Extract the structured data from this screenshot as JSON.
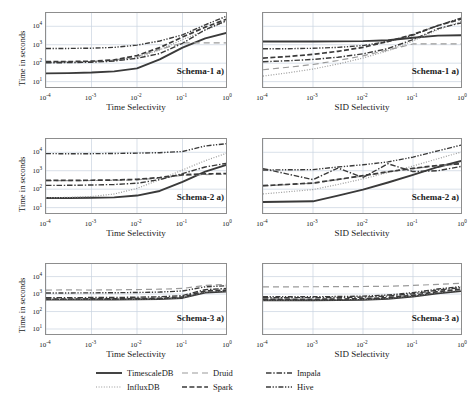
{
  "figure": {
    "background": "#ffffff",
    "width": 476,
    "height": 404
  },
  "legend": {
    "position": "bottom-center",
    "entries": [
      {
        "label": "TimescaleDB",
        "style": "solid",
        "color": "#3a3a3a",
        "width": 1.9
      },
      {
        "label": "InfluxDB",
        "style": "dotted",
        "color": "#9a9a9a",
        "width": 1.2
      },
      {
        "label": "Druid",
        "style": "dashed-long",
        "color": "#9a9a9a",
        "width": 1.2
      },
      {
        "label": "Spark",
        "style": "dashed",
        "color": "#3a3a3a",
        "width": 1.7
      },
      {
        "label": "Impala",
        "style": "dashdot",
        "color": "#3a3a3a",
        "width": 1.4
      },
      {
        "label": "Hive",
        "style": "dashdotdot",
        "color": "#3a3a3a",
        "width": 1.4
      }
    ]
  },
  "axes_common": {
    "ylabel": "Time in seconds",
    "yticks": [
      "10⁻⁴"
    ],
    "ytick_exponents": [
      "1",
      "2",
      "3",
      "4"
    ],
    "xtick_exponents": [
      "-4",
      "-3",
      "-2",
      "-1",
      "0"
    ],
    "ylim_log": [
      0.6,
      4.7
    ],
    "xlim_log": [
      -4,
      0
    ],
    "grid": true,
    "grid_color": "#c9d3e0",
    "mantissa": "10"
  },
  "chart_data": [
    {
      "id": "schema1-time",
      "type": "line",
      "title": "Schema-1 a)",
      "xlabel": "Time Selectivity",
      "ylabel": "Time in seconds",
      "xscale": "log",
      "yscale": "log",
      "xlim": [
        0.0001,
        1
      ],
      "ylim": [
        4,
        50000
      ],
      "x": [
        0.0001,
        0.000316,
        0.001,
        0.00316,
        0.01,
        0.0316,
        0.1,
        0.316,
        1
      ],
      "series": [
        {
          "name": "TimescaleDB",
          "values": [
            28,
            29,
            31,
            36,
            52,
            160,
            700,
            2200,
            4600
          ]
        },
        {
          "name": "InfluxDB",
          "values": [
            110,
            112,
            118,
            135,
            200,
            520,
            1900,
            6000,
            20000
          ]
        },
        {
          "name": "Druid",
          "values": [
            115,
            118,
            125,
            145,
            230,
            560,
            1250,
            1250,
            1250
          ]
        },
        {
          "name": "Spark",
          "values": [
            120,
            122,
            128,
            150,
            260,
            700,
            2600,
            9000,
            26000
          ]
        },
        {
          "name": "Impala",
          "values": [
            105,
            107,
            112,
            130,
            185,
            330,
            1200,
            6500,
            22000
          ]
        },
        {
          "name": "Hive",
          "values": [
            620,
            630,
            650,
            720,
            950,
            1600,
            3400,
            12000,
            38000
          ]
        }
      ]
    },
    {
      "id": "schema1-sid",
      "type": "line",
      "title": "Schema-1 a)",
      "xlabel": "SID Selectivity",
      "ylabel": "Time in seconds",
      "xscale": "log",
      "yscale": "log",
      "xlim": [
        0.0001,
        1
      ],
      "ylim": [
        4,
        50000
      ],
      "x": [
        0.0001,
        0.000316,
        0.001,
        0.00316,
        0.01,
        0.0316,
        0.1,
        0.316,
        1
      ],
      "series": [
        {
          "name": "TimescaleDB",
          "values": [
            1500,
            1500,
            1510,
            1520,
            1560,
            1750,
            2400,
            3100,
            3300
          ]
        },
        {
          "name": "InfluxDB",
          "values": [
            20,
            30,
            48,
            90,
            190,
            470,
            1600,
            6500,
            20000
          ]
        },
        {
          "name": "Druid",
          "values": [
            44,
            60,
            85,
            140,
            250,
            520,
            1100,
            1100,
            1100
          ]
        },
        {
          "name": "Spark",
          "values": [
            190,
            230,
            300,
            440,
            720,
            1500,
            3600,
            11000,
            26000
          ]
        },
        {
          "name": "Impala",
          "values": [
            120,
            135,
            160,
            210,
            320,
            620,
            1900,
            7500,
            16000
          ]
        },
        {
          "name": "Hive",
          "values": [
            600,
            610,
            640,
            720,
            900,
            1500,
            3300,
            11000,
            30000
          ]
        }
      ]
    },
    {
      "id": "schema2-time",
      "type": "line",
      "title": "Schema-2 a)",
      "xlabel": "Time Selectivity",
      "ylabel": "Time in seconds",
      "xscale": "log",
      "yscale": "log",
      "xlim": [
        0.0001,
        1
      ],
      "ylim": [
        4,
        50000
      ],
      "x": [
        0.0001,
        0.000316,
        0.001,
        0.00316,
        0.01,
        0.0316,
        0.1,
        0.316,
        1
      ],
      "series": [
        {
          "name": "TimescaleDB",
          "values": [
            33,
            33,
            34,
            36,
            45,
            80,
            250,
            900,
            2200
          ]
        },
        {
          "name": "InfluxDB",
          "values": [
            34,
            36,
            40,
            55,
            110,
            330,
            1100,
            3500,
            9500
          ]
        },
        {
          "name": "Druid",
          "values": [
            290,
            292,
            295,
            300,
            320,
            400,
            560,
            620,
            650
          ]
        },
        {
          "name": "Spark",
          "values": [
            300,
            300,
            305,
            315,
            340,
            430,
            600,
            680,
            700
          ]
        },
        {
          "name": "Impala",
          "values": [
            160,
            162,
            168,
            180,
            210,
            330,
            700,
            1600,
            2600
          ]
        },
        {
          "name": "Hive",
          "values": [
            8500,
            8300,
            8400,
            8600,
            9000,
            9500,
            11000,
            22000,
            30000
          ]
        }
      ]
    },
    {
      "id": "schema2-sid",
      "type": "line",
      "title": "Schema-2 a)",
      "xlabel": "SID Selectivity",
      "ylabel": "Time in seconds",
      "xscale": "log",
      "yscale": "log",
      "xlim": [
        0.0001,
        1
      ],
      "ylim": [
        4,
        50000
      ],
      "x": [
        0.0001,
        0.001,
        0.00316,
        0.01,
        0.0316,
        0.1,
        0.316,
        1
      ],
      "series": [
        {
          "name": "TimescaleDB",
          "values": [
            20,
            22,
            45,
            95,
            230,
            600,
            1600,
            3600
          ]
        },
        {
          "name": "InfluxDB",
          "values": [
            55,
            95,
            180,
            360,
            800,
            1800,
            4500,
            11000
          ]
        },
        {
          "name": "Druid",
          "values": [
            150,
            210,
            330,
            520,
            850,
            1300,
            1900,
            2400
          ]
        },
        {
          "name": "Spark",
          "values": [
            155,
            215,
            340,
            540,
            880,
            1350,
            1950,
            2450
          ]
        },
        {
          "name": "Impala",
          "values": [
            1300,
            330,
            1400,
            430,
            2400,
            900,
            1000,
            1800
          ]
        },
        {
          "name": "Hive",
          "values": [
            1100,
            1150,
            1600,
            2100,
            3000,
            5500,
            12000,
            26000
          ]
        }
      ]
    },
    {
      "id": "schema3-time",
      "type": "line",
      "title": "Schema-3 a)",
      "xlabel": "Time Selectivity",
      "ylabel": "Time in seconds",
      "xscale": "log",
      "yscale": "log",
      "xlim": [
        0.0001,
        1
      ],
      "ylim": [
        4,
        50000
      ],
      "x": [
        0.0001,
        0.000316,
        0.001,
        0.00316,
        0.01,
        0.0316,
        0.1,
        0.316,
        1
      ],
      "series": [
        {
          "name": "TimescaleDB",
          "values": [
            480,
            480,
            485,
            490,
            500,
            520,
            600,
            1200,
            1400
          ]
        },
        {
          "name": "InfluxDB",
          "values": [
            500,
            500,
            505,
            510,
            520,
            545,
            640,
            1350,
            1550
          ]
        },
        {
          "name": "Druid",
          "values": [
            1700,
            1720,
            1700,
            1750,
            1800,
            1900,
            2100,
            3100,
            3600
          ]
        },
        {
          "name": "Spark",
          "values": [
            520,
            520,
            525,
            530,
            545,
            570,
            680,
            1500,
            1700
          ]
        },
        {
          "name": "Impala",
          "values": [
            620,
            625,
            630,
            640,
            660,
            700,
            820,
            1800,
            2100
          ]
        },
        {
          "name": "Hive",
          "values": [
            1150,
            1160,
            1170,
            1190,
            1230,
            1300,
            1500,
            2600,
            3000
          ]
        }
      ]
    },
    {
      "id": "schema3-sid",
      "type": "line",
      "title": "Schema-3 a)",
      "xlabel": "SID Selectivity",
      "ylabel": "Time in seconds",
      "xscale": "log",
      "yscale": "log",
      "xlim": [
        0.0001,
        1
      ],
      "ylim": [
        4,
        50000
      ],
      "x": [
        0.0001,
        0.000316,
        0.001,
        0.00316,
        0.01,
        0.0316,
        0.1,
        0.316,
        1
      ],
      "series": [
        {
          "name": "TimescaleDB",
          "values": [
            440,
            440,
            442,
            450,
            470,
            540,
            720,
            1100,
            1500
          ]
        },
        {
          "name": "InfluxDB",
          "values": [
            470,
            470,
            473,
            482,
            505,
            580,
            790,
            1250,
            1750
          ]
        },
        {
          "name": "Druid",
          "values": [
            2600,
            2600,
            2620,
            2650,
            2700,
            2800,
            3100,
            3600,
            4200
          ]
        },
        {
          "name": "Spark",
          "values": [
            500,
            500,
            503,
            512,
            540,
            620,
            850,
            1400,
            1950
          ]
        },
        {
          "name": "Impala",
          "values": [
            620,
            620,
            625,
            638,
            670,
            770,
            1050,
            1700,
            2400
          ]
        },
        {
          "name": "Hive",
          "values": [
            700,
            700,
            706,
            720,
            760,
            880,
            1200,
            1950,
            2750
          ]
        }
      ]
    }
  ]
}
